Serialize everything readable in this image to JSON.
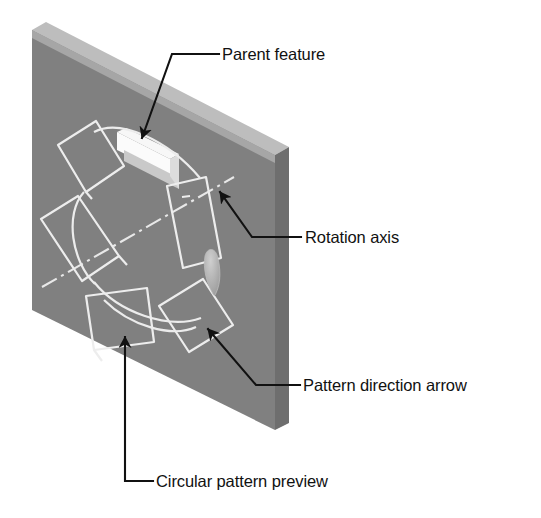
{
  "figure": {
    "type": "technical-illustration",
    "background_color": "#ffffff"
  },
  "colors": {
    "plate_front_face": "#808080",
    "plate_top_face": "#bdbdbd",
    "plate_side_face": "#6e6e6e",
    "slot_highlight": "#f2f2f2",
    "slot_shadow": "#c8c8c8",
    "wireframe_outline": "#ededed",
    "direction_arrow": "#a8a8a8",
    "leader_line": "#111111",
    "label_text": "#111111"
  },
  "labels": [
    {
      "id": "parent-feature",
      "text": "Parent feature"
    },
    {
      "id": "rotation-axis",
      "text": "Rotation axis"
    },
    {
      "id": "pattern-direction-arrow",
      "text": "Pattern direction arrow"
    },
    {
      "id": "circular-pattern-preview",
      "text": "Circular pattern preview"
    }
  ],
  "geometry": {
    "plate": {
      "front_face": "32,30 275,155 275,430 32,310",
      "top_face": "32,30 46,22 289,147 275,155",
      "side_face": "275,155 289,147 289,423 275,430"
    },
    "parent_feature_slot": {
      "top": "118,133 170,160 178,156 126,129",
      "face": "118,133 170,160 170,182 118,155",
      "shadow": "126,148 178,175 178,182 126,160"
    },
    "pattern_instances": [
      "56,146 93,124 120,170 83,193",
      "42,221 79,199 118,257 80,279",
      "87,296 145,289 151,341 94,347",
      "160,305 202,280 232,324 188,349",
      "168,186 205,178 220,259 183,268"
    ],
    "preview_arcs": [
      "M 92,131 A 80 92 0 0 1 205,179",
      "M 83,193 A 55 63 0 0 0 94,283",
      "M 93,280 A 74 82 0 0 0 200,317"
    ],
    "rotation_axis_line": "44,285 232,178",
    "direction_arrow_tip": "212,290"
  },
  "leaders": [
    {
      "id": "leader-parent-feature",
      "path": "218,53 172,53 139,143",
      "arrow_at": "139,143",
      "arrow_angle": 110
    },
    {
      "id": "leader-rotation-axis",
      "path": "300,236 253,236 219,190",
      "arrow_at": "219,190",
      "arrow_angle": 234
    },
    {
      "id": "leader-pattern-direction-arrow",
      "path": "299,384 256,384 205,326",
      "arrow_at": "205,326",
      "arrow_angle": 229
    },
    {
      "id": "leader-circular-pattern-preview",
      "path": "152,480 124,480 124,331",
      "arrow_at": "124,331",
      "arrow_angle": 270
    }
  ]
}
